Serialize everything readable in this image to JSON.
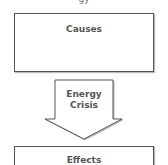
{
  "diagram": {
    "top_partial_text": "gy",
    "causes": {
      "label": "Causes"
    },
    "arrow": {
      "line1": "Energy",
      "line2": "Crisis"
    },
    "effects": {
      "label": "Effects"
    }
  },
  "colors": {
    "stroke": "#555555",
    "text": "#555555",
    "background": "#ffffff"
  }
}
